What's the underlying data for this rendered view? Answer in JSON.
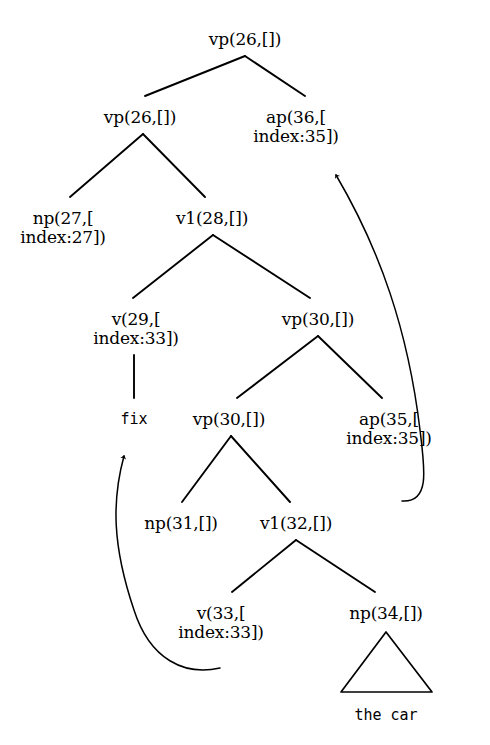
{
  "figure": {
    "type": "syntax-tree-diagram",
    "background_color": "#ffffff",
    "ink_color": "#000000",
    "width": 490,
    "height": 745
  },
  "nodes": [
    {
      "id": "n26root",
      "line1": "vp(26,[])",
      "line2": "",
      "x": 245,
      "y": 30,
      "kind": "nonterminal"
    },
    {
      "id": "n26left",
      "line1": "vp(26,[])",
      "line2": "",
      "x": 140,
      "y": 108,
      "kind": "nonterminal"
    },
    {
      "id": "n36",
      "line1": "ap(36,[",
      "line2": "index:35])",
      "x": 296,
      "y": 108,
      "kind": "nonterminal"
    },
    {
      "id": "n27",
      "line1": "np(27,[",
      "line2": "index:27])",
      "x": 63,
      "y": 209,
      "kind": "nonterminal"
    },
    {
      "id": "n28",
      "line1": "v1(28,[])",
      "line2": "",
      "x": 212,
      "y": 209,
      "kind": "nonterminal"
    },
    {
      "id": "n29",
      "line1": "v(29,[",
      "line2": "index:33])",
      "x": 136,
      "y": 310,
      "kind": "nonterminal"
    },
    {
      "id": "n30upper",
      "line1": "vp(30,[])",
      "line2": "",
      "x": 318,
      "y": 310,
      "kind": "nonterminal"
    },
    {
      "id": "n30lower",
      "line1": "vp(30,[])",
      "line2": "",
      "x": 229,
      "y": 410,
      "kind": "nonterminal"
    },
    {
      "id": "n35",
      "line1": "ap(35,[",
      "line2": "index:35])",
      "x": 389,
      "y": 410,
      "kind": "nonterminal"
    },
    {
      "id": "n31",
      "line1": "np(31,[])",
      "line2": "",
      "x": 181,
      "y": 514,
      "kind": "nonterminal"
    },
    {
      "id": "n32",
      "line1": "v1(32,[])",
      "line2": "",
      "x": 296,
      "y": 514,
      "kind": "nonterminal"
    },
    {
      "id": "n33",
      "line1": "v(33,[",
      "line2": "index:33])",
      "x": 221,
      "y": 604,
      "kind": "nonterminal"
    },
    {
      "id": "n34",
      "line1": "np(34,[])",
      "line2": "",
      "x": 386,
      "y": 604,
      "kind": "nonterminal"
    }
  ],
  "terminals": [
    {
      "id": "t_fix",
      "text": "fix",
      "x": 134,
      "y": 410
    },
    {
      "id": "t_thecar",
      "text": "the car",
      "x": 386,
      "y": 706
    }
  ],
  "edges": [
    {
      "from": "n26root",
      "to": "n26left",
      "x1": 245,
      "y1": 56,
      "x2": 145,
      "y2": 96
    },
    {
      "from": "n26root",
      "to": "n36",
      "x1": 245,
      "y1": 56,
      "x2": 305,
      "y2": 96
    },
    {
      "from": "n26left",
      "to": "n27",
      "x1": 143,
      "y1": 134,
      "x2": 70,
      "y2": 197
    },
    {
      "from": "n26left",
      "to": "n28",
      "x1": 143,
      "y1": 134,
      "x2": 205,
      "y2": 197
    },
    {
      "from": "n28",
      "to": "n29",
      "x1": 213,
      "y1": 235,
      "x2": 133,
      "y2": 298
    },
    {
      "from": "n28",
      "to": "n30upper",
      "x1": 213,
      "y1": 235,
      "x2": 310,
      "y2": 298
    },
    {
      "from": "n29",
      "to": "t_fix",
      "x1": 134,
      "y1": 355,
      "x2": 134,
      "y2": 398
    },
    {
      "from": "n30upper",
      "to": "n30lower",
      "x1": 318,
      "y1": 336,
      "x2": 237,
      "y2": 398
    },
    {
      "from": "n30upper",
      "to": "n35",
      "x1": 318,
      "y1": 336,
      "x2": 382,
      "y2": 398
    },
    {
      "from": "n30lower",
      "to": "n31",
      "x1": 231,
      "y1": 436,
      "x2": 182,
      "y2": 502
    },
    {
      "from": "n30lower",
      "to": "n32",
      "x1": 231,
      "y1": 436,
      "x2": 290,
      "y2": 502
    },
    {
      "from": "n32",
      "to": "n33",
      "x1": 296,
      "y1": 540,
      "x2": 232,
      "y2": 592
    },
    {
      "from": "n32",
      "to": "n34",
      "x1": 296,
      "y1": 540,
      "x2": 375,
      "y2": 592
    }
  ],
  "coindex_arrows": [
    {
      "id": "arrow-ap35-to-ap36",
      "from": "n35",
      "to": "n36",
      "path": "M 402 501 C 430 503 425 470 420 430 C 408 330 380 250 336 175",
      "arrow_tip": {
        "x": 336,
        "y": 172
      },
      "description": "curved arrow from ap(35) up to ap(36)"
    },
    {
      "id": "arrow-v33-to-fix",
      "from": "n33",
      "to": "t_fix",
      "path": "M 220 668 C 185 676 150 660 134 610 C 112 545 112 500 124 456",
      "arrow_tip": {
        "x": 125,
        "y": 452
      },
      "description": "curved arrow from v(33) up to fix"
    }
  ],
  "triangles": [
    {
      "id": "triangle-np34",
      "parent": "n34",
      "apex": {
        "x": 386,
        "y": 632
      },
      "left": {
        "x": 341,
        "y": 692
      },
      "right": {
        "x": 432,
        "y": 692
      },
      "label": "the car"
    }
  ]
}
